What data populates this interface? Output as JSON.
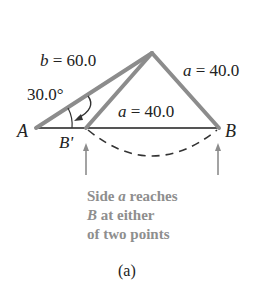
{
  "diagram": {
    "labels": {
      "b_var": "b",
      "b_eq": " = 60.0",
      "a_right_var": "a",
      "a_right_eq": " = 40.0",
      "a_inner_var": "a",
      "a_inner_eq": " = 40.0",
      "angle": "30.0°",
      "vertex_a": "A",
      "vertex_b": "B",
      "vertex_b_prime": "B'"
    },
    "note": {
      "line1_pre": "Side ",
      "line1_var": "a",
      "line1_post": " reaches",
      "line2_var": "B",
      "line2_post": " at either",
      "line3": "of two points"
    },
    "caption": "(a)",
    "colors": {
      "triangle_stroke": "#8c8c8c",
      "baseline": "#555555",
      "note_text": "#8e8e8e",
      "label_text": "#222222"
    }
  }
}
